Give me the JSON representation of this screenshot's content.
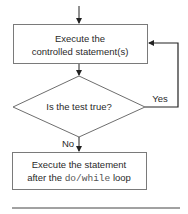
{
  "diagram": {
    "type": "flowchart",
    "colors": {
      "stroke": "#6e6e6e",
      "line": "#333333",
      "text": "#2a2a2a",
      "code": "#555555",
      "background": "#ffffff"
    },
    "nodes": [
      {
        "id": "execute_body",
        "shape": "rectangle",
        "lines": [
          "Execute the",
          "controlled statement(s)"
        ]
      },
      {
        "id": "test",
        "shape": "diamond",
        "label": "Is the test true?"
      },
      {
        "id": "after_loop",
        "shape": "rectangle",
        "line1": "Execute the statement",
        "line2_prefix": "after the ",
        "line2_code": "do/while",
        "line2_suffix": " loop"
      }
    ],
    "edges": [
      {
        "from": "entry",
        "to": "execute_body",
        "label": ""
      },
      {
        "from": "execute_body",
        "to": "test",
        "label": ""
      },
      {
        "from": "test",
        "to": "execute_body",
        "label": "Yes"
      },
      {
        "from": "test",
        "to": "after_loop",
        "label": "No"
      }
    ]
  }
}
